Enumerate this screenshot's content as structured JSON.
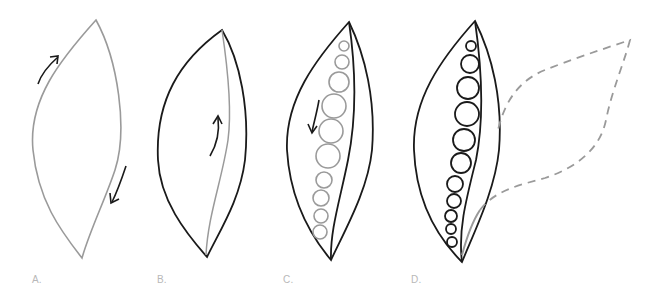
{
  "figure": {
    "panels": [
      {
        "id": "A",
        "label": "A.",
        "description": "Gray leaf/pod outline with two curved arrows indicating stroke direction"
      },
      {
        "id": "B",
        "label": "B.",
        "description": "Black pod outline with gray inner seam line and upward arrow"
      },
      {
        "id": "C",
        "label": "C.",
        "description": "Pod with gray circles (peas) along seam and downward arrow"
      },
      {
        "id": "D",
        "label": "D.",
        "description": "Completed pod with black peas and dashed gray outline of open half"
      }
    ],
    "colors": {
      "ink": "#1a1a1a",
      "pencil": "#9a9a9a",
      "label": "#b8b8b8",
      "background": "#ffffff"
    }
  }
}
